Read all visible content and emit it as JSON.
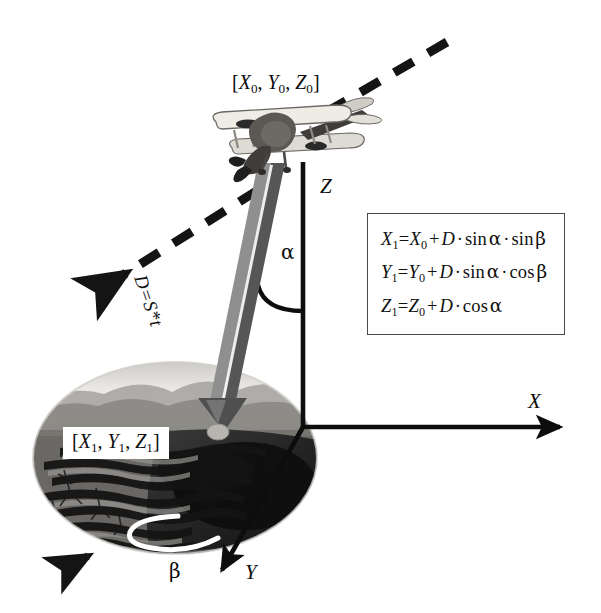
{
  "figure": {
    "background_color": "#ffffff",
    "ink_color": "#111111"
  },
  "labels": {
    "aircraft_position": {
      "text": "[X0, Y0, Z0]",
      "open": "[",
      "x": "X",
      "x_sub": "0",
      "sep1": ", ",
      "y": "Y",
      "y_sub": "0",
      "sep2": ", ",
      "z": "Z",
      "z_sub": "0",
      "close": "]"
    },
    "ground_point": {
      "text": "[X1, Y1, Z1]",
      "open": "[",
      "x": "X",
      "x_sub": "1",
      "sep1": ", ",
      "y": "Y",
      "y_sub": "1",
      "sep2": ", ",
      "z": "Z",
      "z_sub": "1",
      "close": "]"
    },
    "distance_vector": {
      "d": "D",
      "equals": "=",
      "s": "S",
      "star": "*",
      "t": "t",
      "full": "D=S*t"
    },
    "axis_x": "X",
    "axis_y": "Y",
    "axis_z": "Z",
    "angle_alpha": "α",
    "angle_beta": "β"
  },
  "formulas": [
    {
      "id": "formula-x",
      "lhs": "X",
      "lhs_sub": "1",
      "eq": "=",
      "term0": "X",
      "term0_sub": "0",
      "plus": "+",
      "d": "D",
      "dot1": "·",
      "fn1": "sin",
      "arg1": "α",
      "dot2": "·",
      "fn2": "sin",
      "arg2": "β",
      "plain": "X1=X0 + D · sin α · sin β"
    },
    {
      "id": "formula-y",
      "lhs": "Y",
      "lhs_sub": "1",
      "eq": "=",
      "term0": "Y",
      "term0_sub": "0",
      "plus": "+",
      "d": "D",
      "dot1": "·",
      "fn1": "sin",
      "arg1": "α",
      "dot2": "·",
      "fn2": "cos",
      "arg2": "β",
      "plain": "Y1=Y0 + D · sin α · cos β"
    },
    {
      "id": "formula-z",
      "lhs": "Z",
      "lhs_sub": "1",
      "eq": "=",
      "term0": "Z",
      "term0_sub": "0",
      "plus": "+",
      "d": "D",
      "dot1": "·",
      "fn1": "cos",
      "arg1": "α",
      "dot2": "",
      "fn2": "",
      "arg2": "",
      "plain": "Z1=Z0 + D · cos α"
    }
  ],
  "graphics": {
    "flight_path": {
      "name": "dashed flight path",
      "style": "thick dashed line with arrowhead",
      "direction": "from upper-right to lower-left",
      "color": "#111111"
    },
    "aircraft": {
      "name": "biplane",
      "color_light": "#e8e6e0",
      "color_dark": "#4a4744"
    },
    "terrain": {
      "name": "terrain ellipse photo",
      "description": "grayscale landscape with mountain ridges",
      "color_light": "#d8d6d2",
      "color_dark": "#1b1b1b"
    },
    "beam": {
      "name": "laser range vector",
      "color_left": "#8d8d8d",
      "color_right": "#595959"
    },
    "axes": {
      "color": "#0d0d0d",
      "origin_x": 303,
      "origin_y": 427
    }
  }
}
